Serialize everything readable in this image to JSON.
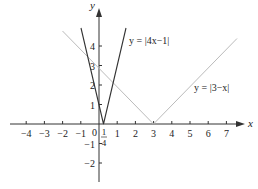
{
  "chart_data": {
    "type": "line",
    "title": "",
    "xlabel": "x",
    "ylabel": "y",
    "x_ticks": [
      "-4",
      "-3",
      "-2",
      "-1",
      "0",
      "1/4",
      "1",
      "2",
      "3",
      "4",
      "5",
      "6",
      "7"
    ],
    "y_ticks": [
      "-2",
      "-1",
      "1",
      "2",
      "3",
      "4"
    ],
    "xlim": [
      -5,
      8
    ],
    "ylim": [
      -3,
      5.5
    ],
    "grid": false,
    "series": [
      {
        "name": "y = |4x−1|",
        "expression": "|4x-1|",
        "vertex": [
          0.25,
          0
        ],
        "color": "#333333"
      },
      {
        "name": "y = |3−x|",
        "expression": "|3-x|",
        "vertex": [
          3,
          0
        ],
        "color": "#bbbbbb"
      }
    ],
    "annotations": [
      "y = |4x−1|",
      "y = |3−x|"
    ]
  },
  "labels": {
    "x_axis": "x",
    "y_axis": "y",
    "origin": "0",
    "label_4x": "y = |4x−1|",
    "label_3x": "y = |3−x|",
    "frac_num": "1",
    "frac_den": "4"
  },
  "xticks": [
    {
      "v": -4,
      "t": "−4"
    },
    {
      "v": -3,
      "t": "−3"
    },
    {
      "v": -2,
      "t": "−2"
    },
    {
      "v": -1,
      "t": "−1"
    },
    {
      "v": 1,
      "t": "1"
    },
    {
      "v": 2,
      "t": "2"
    },
    {
      "v": 3,
      "t": "3"
    },
    {
      "v": 4,
      "t": "4"
    },
    {
      "v": 5,
      "t": "5"
    },
    {
      "v": 6,
      "t": "6"
    },
    {
      "v": 7,
      "t": "7"
    }
  ],
  "yticks": [
    {
      "v": -2,
      "t": "−2"
    },
    {
      "v": -1,
      "t": "−1"
    },
    {
      "v": 1,
      "t": "1"
    },
    {
      "v": 2,
      "t": "2"
    },
    {
      "v": 3,
      "t": "3"
    },
    {
      "v": 4,
      "t": "4"
    }
  ]
}
